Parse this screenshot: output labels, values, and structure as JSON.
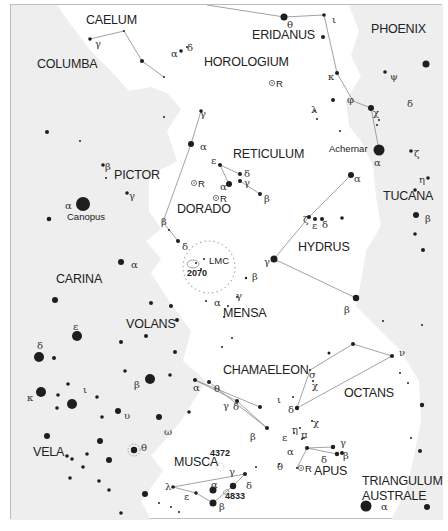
{
  "map": {
    "title": "Southern sky star chart",
    "colors": {
      "background": "#ffffff",
      "milky_way_shade": "#efefef",
      "border": "#b8b8b8",
      "star": "#1e1e1e",
      "line": "#8a8a8a",
      "text": "#222222"
    },
    "constellations": [
      {
        "name": "CAELUM",
        "x": 85,
        "y": 23
      },
      {
        "name": "ERIDANUS",
        "x": 251,
        "y": 38
      },
      {
        "name": "PHOENIX",
        "x": 370,
        "y": 32
      },
      {
        "name": "COLUMBA",
        "x": 36,
        "y": 67
      },
      {
        "name": "HOROLOGIUM",
        "x": 203,
        "y": 65
      },
      {
        "name": "RETICULUM",
        "x": 232,
        "y": 157
      },
      {
        "name": "PICTOR",
        "x": 113,
        "y": 178
      },
      {
        "name": "DORADO",
        "x": 176,
        "y": 212
      },
      {
        "name": "TUCANA",
        "x": 382,
        "y": 199
      },
      {
        "name": "HYDRUS",
        "x": 297,
        "y": 250
      },
      {
        "name": "CARINA",
        "x": 55,
        "y": 282
      },
      {
        "name": "MENSA",
        "x": 222,
        "y": 316
      },
      {
        "name": "VOLANS",
        "x": 125,
        "y": 327
      },
      {
        "name": "CHAMAELEON",
        "x": 222,
        "y": 373
      },
      {
        "name": "OCTANS",
        "x": 343,
        "y": 396
      },
      {
        "name": "VELA",
        "x": 32,
        "y": 455
      },
      {
        "name": "MUSCA",
        "x": 173,
        "y": 465
      },
      {
        "name": "APUS",
        "x": 313,
        "y": 474
      },
      {
        "name": "TRIANGULUM",
        "x": 361,
        "y": 484
      },
      {
        "name": "AUSTRALE",
        "x": 361,
        "y": 499
      }
    ],
    "named_stars": [
      {
        "name": "Canopus",
        "x": 66,
        "y": 219
      },
      {
        "name": "Achernar",
        "x": 328,
        "y": 151
      }
    ],
    "deep_sky_objects": [
      {
        "name": "LMC",
        "x": 208,
        "y": 263
      },
      {
        "name": "2070",
        "x": 186,
        "y": 275
      },
      {
        "name": "4372",
        "x": 209,
        "y": 455
      },
      {
        "name": "4833",
        "x": 224,
        "y": 498
      }
    ],
    "variable_stars": [
      {
        "label": "R",
        "x": 271,
        "y": 82
      },
      {
        "label": "R",
        "x": 193,
        "y": 182
      },
      {
        "label": "R",
        "x": 215,
        "y": 197
      },
      {
        "label": "R",
        "x": 300,
        "y": 467
      }
    ],
    "greek_labels": [
      {
        "t": "γ",
        "x": 94,
        "y": 43
      },
      {
        "t": "α",
        "x": 170,
        "y": 53
      },
      {
        "t": "δ",
        "x": 186,
        "y": 47
      },
      {
        "t": "θ",
        "x": 286,
        "y": 24
      },
      {
        "t": "ι",
        "x": 331,
        "y": 19
      },
      {
        "t": "κ",
        "x": 327,
        "y": 76
      },
      {
        "t": "ψ",
        "x": 389,
        "y": 76
      },
      {
        "t": "φ",
        "x": 346,
        "y": 99
      },
      {
        "t": "λ",
        "x": 310,
        "y": 109
      },
      {
        "t": "χ",
        "x": 372,
        "y": 112
      },
      {
        "t": "δ",
        "x": 406,
        "y": 103
      },
      {
        "t": "α",
        "x": 373,
        "y": 162
      },
      {
        "t": "ζ",
        "x": 413,
        "y": 153
      },
      {
        "t": "η",
        "x": 418,
        "y": 179
      },
      {
        "t": "α",
        "x": 353,
        "y": 178
      },
      {
        "t": "β",
        "x": 424,
        "y": 218
      },
      {
        "t": "γ",
        "x": 199,
        "y": 113
      },
      {
        "t": "α",
        "x": 199,
        "y": 146
      },
      {
        "t": "ε",
        "x": 210,
        "y": 160
      },
      {
        "t": "δ",
        "x": 243,
        "y": 173
      },
      {
        "t": "γ",
        "x": 243,
        "y": 182
      },
      {
        "t": "α",
        "x": 219,
        "y": 186
      },
      {
        "t": "β",
        "x": 263,
        "y": 198
      },
      {
        "t": "β",
        "x": 104,
        "y": 166
      },
      {
        "t": "γ",
        "x": 128,
        "y": 195
      },
      {
        "t": "α",
        "x": 64,
        "y": 205
      },
      {
        "t": "β",
        "x": 160,
        "y": 221
      },
      {
        "t": "δ",
        "x": 181,
        "y": 246
      },
      {
        "t": "ζ",
        "x": 302,
        "y": 219
      },
      {
        "t": "ε",
        "x": 311,
        "y": 225
      },
      {
        "t": "δ",
        "x": 321,
        "y": 224
      },
      {
        "t": "γ",
        "x": 263,
        "y": 261
      },
      {
        "t": "β",
        "x": 251,
        "y": 276
      },
      {
        "t": "γ",
        "x": 235,
        "y": 295
      },
      {
        "t": "α",
        "x": 213,
        "y": 302
      },
      {
        "t": "α",
        "x": 130,
        "y": 264
      },
      {
        "t": "β",
        "x": 343,
        "y": 309
      },
      {
        "t": "ε",
        "x": 72,
        "y": 326
      },
      {
        "t": "δ",
        "x": 36,
        "y": 345
      },
      {
        "t": "α",
        "x": 192,
        "y": 387
      },
      {
        "t": "θ",
        "x": 213,
        "y": 388
      },
      {
        "t": "σ",
        "x": 308,
        "y": 374
      },
      {
        "t": "χ",
        "x": 311,
        "y": 385
      },
      {
        "t": "ν",
        "x": 398,
        "y": 352
      },
      {
        "t": "ι",
        "x": 276,
        "y": 399
      },
      {
        "t": "δ",
        "x": 232,
        "y": 406
      },
      {
        "t": "δ",
        "x": 287,
        "y": 409
      },
      {
        "t": "η",
        "x": 291,
        "y": 429
      },
      {
        "t": "ε",
        "x": 281,
        "y": 437
      },
      {
        "t": "π",
        "x": 300,
        "y": 434
      },
      {
        "t": "χ",
        "x": 312,
        "y": 422
      },
      {
        "t": "γ",
        "x": 222,
        "y": 405
      },
      {
        "t": "β",
        "x": 249,
        "y": 436
      },
      {
        "t": "κ",
        "x": 26,
        "y": 397
      },
      {
        "t": "ι",
        "x": 82,
        "y": 389
      },
      {
        "t": "β",
        "x": 133,
        "y": 384
      },
      {
        "t": "υ",
        "x": 123,
        "y": 415
      },
      {
        "t": "ω",
        "x": 163,
        "y": 431
      },
      {
        "t": "θ",
        "x": 140,
        "y": 447
      },
      {
        "t": "α",
        "x": 286,
        "y": 451
      },
      {
        "t": "γ",
        "x": 339,
        "y": 442
      },
      {
        "t": "δ",
        "x": 320,
        "y": 459
      },
      {
        "t": "β",
        "x": 342,
        "y": 455
      },
      {
        "t": "θ",
        "x": 276,
        "y": 466
      },
      {
        "t": "γ",
        "x": 228,
        "y": 471
      },
      {
        "t": "λ",
        "x": 164,
        "y": 486
      },
      {
        "t": "α",
        "x": 210,
        "y": 484
      },
      {
        "t": "δ",
        "x": 245,
        "y": 485
      },
      {
        "t": "ε",
        "x": 183,
        "y": 496
      },
      {
        "t": "β",
        "x": 218,
        "y": 506
      },
      {
        "t": "α",
        "x": 380,
        "y": 506
      }
    ],
    "stars": [
      [
        89,
        38,
        1.8
      ],
      [
        123,
        30,
        1
      ],
      [
        141,
        60,
        2
      ],
      [
        163,
        76,
        1
      ],
      [
        180,
        50,
        1.8
      ],
      [
        186,
        46,
        1
      ],
      [
        283,
        16,
        3.5
      ],
      [
        323,
        14,
        1.8
      ],
      [
        322,
        36,
        2
      ],
      [
        336,
        72,
        2
      ],
      [
        384,
        71,
        1.8
      ],
      [
        425,
        63,
        3.5
      ],
      [
        314,
        110,
        1
      ],
      [
        316,
        118,
        1
      ],
      [
        332,
        99,
        2
      ],
      [
        370,
        107,
        3
      ],
      [
        376,
        124,
        1
      ],
      [
        378,
        119,
        1
      ],
      [
        339,
        130,
        1
      ],
      [
        378,
        149,
        5.5
      ],
      [
        410,
        150,
        1.8
      ],
      [
        427,
        177,
        1.8
      ],
      [
        350,
        174,
        3
      ],
      [
        414,
        189,
        1.8
      ],
      [
        415,
        214,
        3
      ],
      [
        414,
        233,
        1.8
      ],
      [
        422,
        249,
        2
      ],
      [
        163,
        116,
        1
      ],
      [
        200,
        110,
        1.8
      ],
      [
        190,
        143,
        3
      ],
      [
        219,
        164,
        2
      ],
      [
        239,
        173,
        2
      ],
      [
        239,
        180,
        2
      ],
      [
        228,
        183,
        3
      ],
      [
        259,
        193,
        2
      ],
      [
        46,
        131,
        2
      ],
      [
        79,
        140,
        1
      ],
      [
        102,
        164,
        1.8
      ],
      [
        105,
        177,
        1
      ],
      [
        126,
        192,
        1.8
      ],
      [
        82,
        203,
        7
      ],
      [
        48,
        218,
        2.3
      ],
      [
        168,
        229,
        1
      ],
      [
        177,
        240,
        2
      ],
      [
        308,
        216,
        2
      ],
      [
        314,
        218,
        2
      ],
      [
        321,
        218,
        2
      ],
      [
        341,
        217,
        1.8
      ],
      [
        273,
        258,
        3.5
      ],
      [
        355,
        297,
        3.2
      ],
      [
        421,
        324,
        1
      ],
      [
        245,
        277,
        1.2
      ],
      [
        236,
        296,
        1
      ],
      [
        205,
        300,
        1
      ],
      [
        227,
        305,
        1
      ],
      [
        195,
        262,
        1
      ],
      [
        200,
        268,
        1
      ],
      [
        203,
        258,
        1
      ],
      [
        120,
        261,
        3
      ],
      [
        54,
        299,
        3
      ],
      [
        150,
        302,
        2
      ],
      [
        170,
        305,
        2
      ],
      [
        176,
        319,
        2
      ],
      [
        145,
        335,
        2
      ],
      [
        120,
        341,
        2
      ],
      [
        174,
        351,
        2
      ],
      [
        76,
        335,
        5
      ],
      [
        38,
        356,
        5
      ],
      [
        53,
        357,
        2
      ],
      [
        223,
        316,
        1
      ],
      [
        231,
        337,
        1
      ],
      [
        221,
        346,
        1
      ],
      [
        194,
        379,
        2
      ],
      [
        208,
        381,
        2
      ],
      [
        236,
        400,
        2
      ],
      [
        259,
        406,
        2
      ],
      [
        266,
        427,
        2
      ],
      [
        309,
        369,
        1
      ],
      [
        312,
        380,
        1
      ],
      [
        292,
        396,
        1
      ],
      [
        296,
        407,
        2.2
      ],
      [
        328,
        352,
        1.5
      ],
      [
        352,
        343,
        2
      ],
      [
        391,
        355,
        2
      ],
      [
        399,
        372,
        1
      ],
      [
        407,
        382,
        1
      ],
      [
        421,
        404,
        2.2
      ],
      [
        410,
        437,
        1
      ],
      [
        419,
        450,
        2
      ],
      [
        382,
        320,
        1
      ],
      [
        299,
        427,
        1
      ],
      [
        303,
        437,
        1
      ],
      [
        311,
        420,
        1
      ],
      [
        301,
        438,
        1
      ],
      [
        293,
        432,
        1
      ],
      [
        306,
        447,
        2
      ],
      [
        332,
        446,
        2.2
      ],
      [
        336,
        453,
        2.2
      ],
      [
        341,
        452,
        2
      ],
      [
        278,
        463,
        1
      ],
      [
        296,
        467,
        1
      ],
      [
        124,
        370,
        1.8
      ],
      [
        149,
        378,
        5
      ],
      [
        169,
        374,
        1.8
      ],
      [
        67,
        383,
        1.8
      ],
      [
        71,
        403,
        5
      ],
      [
        96,
        396,
        1.8
      ],
      [
        40,
        391,
        5
      ],
      [
        57,
        394,
        1.8
      ],
      [
        56,
        407,
        1.8
      ],
      [
        101,
        416,
        1.8
      ],
      [
        117,
        410,
        3
      ],
      [
        158,
        416,
        3
      ],
      [
        188,
        411,
        1.8
      ],
      [
        46,
        435,
        3
      ],
      [
        99,
        440,
        3
      ],
      [
        66,
        455,
        1.8
      ],
      [
        71,
        458,
        1.8
      ],
      [
        86,
        453,
        1.8
      ],
      [
        82,
        466,
        1.8
      ],
      [
        108,
        459,
        3
      ],
      [
        133,
        449,
        3.2
      ],
      [
        69,
        477,
        1.8
      ],
      [
        98,
        480,
        1.8
      ],
      [
        108,
        489,
        1.8
      ],
      [
        144,
        493,
        3
      ],
      [
        158,
        502,
        1
      ],
      [
        170,
        506,
        1
      ],
      [
        178,
        511,
        1
      ],
      [
        120,
        512,
        1.8
      ],
      [
        244,
        473,
        2
      ],
      [
        232,
        485,
        3.2
      ],
      [
        172,
        486,
        1.8
      ],
      [
        195,
        492,
        1.8
      ],
      [
        212,
        489,
        3.5
      ],
      [
        212,
        502,
        3.5
      ],
      [
        255,
        466,
        1
      ],
      [
        365,
        505,
        5.5
      ],
      [
        426,
        506,
        3
      ]
    ],
    "lines": [
      [
        [
          89,
          38
        ],
        [
          123,
          30
        ]
      ],
      [
        [
          123,
          30
        ],
        [
          141,
          60
        ]
      ],
      [
        [
          141,
          60
        ],
        [
          163,
          76
        ]
      ],
      [
        [
          206,
          4
        ],
        [
          283,
          16
        ]
      ],
      [
        [
          283,
          16
        ],
        [
          323,
          14
        ]
      ],
      [
        [
          323,
          14
        ],
        [
          336,
          72
        ]
      ],
      [
        [
          336,
          72
        ],
        [
          352,
          100
        ]
      ],
      [
        [
          352,
          100
        ],
        [
          370,
          107
        ]
      ],
      [
        [
          370,
          107
        ],
        [
          378,
          149
        ]
      ],
      [
        [
          200,
          110
        ],
        [
          190,
          143
        ]
      ],
      [
        [
          190,
          143
        ],
        [
          162,
          221
        ]
      ],
      [
        [
          162,
          221
        ],
        [
          177,
          240
        ]
      ],
      [
        [
          219,
          164
        ],
        [
          228,
          183
        ]
      ],
      [
        [
          219,
          164
        ],
        [
          239,
          173
        ]
      ],
      [
        [
          239,
          180
        ],
        [
          259,
          193
        ]
      ],
      [
        [
          350,
          174
        ],
        [
          308,
          216
        ]
      ],
      [
        [
          308,
          216
        ],
        [
          273,
          258
        ]
      ],
      [
        [
          273,
          258
        ],
        [
          355,
          297
        ]
      ],
      [
        [
          194,
          379
        ],
        [
          236,
          400
        ]
      ],
      [
        [
          194,
          379
        ],
        [
          259,
          406
        ]
      ],
      [
        [
          208,
          381
        ],
        [
          266,
          427
        ]
      ],
      [
        [
          236,
          400
        ],
        [
          266,
          427
        ]
      ],
      [
        [
          309,
          369
        ],
        [
          296,
          407
        ]
      ],
      [
        [
          309,
          369
        ],
        [
          352,
          343
        ]
      ],
      [
        [
          352,
          343
        ],
        [
          391,
          355
        ]
      ],
      [
        [
          391,
          355
        ],
        [
          296,
          407
        ]
      ],
      [
        [
          306,
          447
        ],
        [
          332,
          446
        ]
      ],
      [
        [
          306,
          447
        ],
        [
          336,
          453
        ]
      ],
      [
        [
          306,
          447
        ],
        [
          296,
          467
        ]
      ],
      [
        [
          172,
          486
        ],
        [
          244,
          473
        ]
      ],
      [
        [
          172,
          486
        ],
        [
          195,
          492
        ]
      ],
      [
        [
          195,
          492
        ],
        [
          212,
          502
        ]
      ],
      [
        [
          244,
          473
        ],
        [
          232,
          485
        ]
      ],
      [
        [
          212,
          502
        ],
        [
          232,
          485
        ]
      ]
    ]
  }
}
